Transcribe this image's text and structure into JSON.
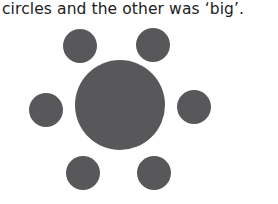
{
  "caption": "circles and the other was ‘big’.",
  "figure": {
    "fill": "#58585a",
    "big_circle": {
      "cx": 120,
      "cy": 105,
      "r": 45
    },
    "small_circles": [
      {
        "cx": 80,
        "cy": 46,
        "r": 17
      },
      {
        "cx": 153,
        "cy": 45,
        "r": 17
      },
      {
        "cx": 46,
        "cy": 110,
        "r": 17
      },
      {
        "cx": 194,
        "cy": 107,
        "r": 17
      },
      {
        "cx": 83,
        "cy": 173,
        "r": 17
      },
      {
        "cx": 154,
        "cy": 173,
        "r": 17
      }
    ]
  }
}
